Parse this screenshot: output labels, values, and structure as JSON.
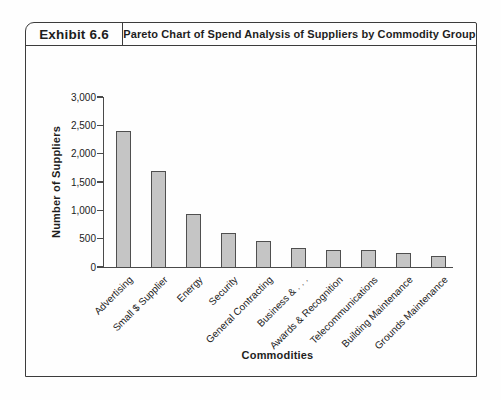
{
  "header": {
    "exhibit_label": "Exhibit 6.6",
    "title": "Pareto Chart of Spend Analysis of Suppliers by Commodity Group"
  },
  "chart_data": {
    "type": "bar",
    "title": "Pareto Chart of Spend Analysis of Suppliers by Commodity Group",
    "xlabel": "Commodities",
    "ylabel": "Number of Suppliers",
    "categories": [
      "Advertising",
      "Small $ Supplier",
      "Energy",
      "Security",
      "General Contracting",
      "Business & . . .",
      "Awards & Recognition",
      "Telecommunications",
      "Building Maintenance",
      "Grounds Maintenance"
    ],
    "values": [
      2400,
      1700,
      930,
      600,
      450,
      330,
      300,
      300,
      250,
      200
    ],
    "ylim": [
      0,
      3000
    ],
    "ytick_interval": 500,
    "ytick_labels": [
      "0",
      "500",
      "1,000",
      "1,500",
      "2,000",
      "2,500",
      "3,000"
    ],
    "grid": false,
    "legend": false,
    "bar_fill": "#c5c5c5",
    "bar_border": "#4f4f4f",
    "axis_color": "#4a4a4a",
    "frame_border_color": "#3c3c3c"
  }
}
